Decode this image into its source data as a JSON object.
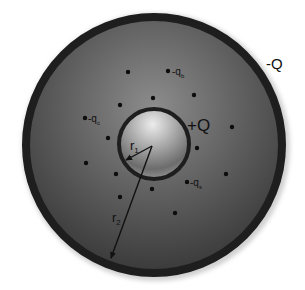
{
  "diagram": {
    "type": "concentric-spheres-charge",
    "outer_shell": {
      "label": "-Q",
      "cx": 154,
      "cy": 145,
      "r": 132,
      "ring_width": 8,
      "ring_color": "#1e1e1e"
    },
    "inner_sphere": {
      "label": "+Q",
      "cx": 154,
      "cy": 144,
      "r": 36,
      "ring_width": 4,
      "ring_color": "#1e1e1e"
    },
    "radii": {
      "r1": {
        "label": "r",
        "sub": "1"
      },
      "r2": {
        "label": "r",
        "sub": "2"
      }
    },
    "charge_labels": [
      {
        "text": "-q",
        "sub": "b",
        "x": 176,
        "y": 74
      },
      {
        "text": "-q",
        "sub": "c",
        "x": 91,
        "y": 121
      },
      {
        "text": "-q",
        "sub": "s",
        "x": 193,
        "y": 185
      }
    ],
    "dots": [
      {
        "x": 128,
        "y": 72
      },
      {
        "x": 168,
        "y": 71
      },
      {
        "x": 153,
        "y": 98
      },
      {
        "x": 194,
        "y": 95
      },
      {
        "x": 120,
        "y": 105
      },
      {
        "x": 85,
        "y": 118
      },
      {
        "x": 232,
        "y": 127
      },
      {
        "x": 108,
        "y": 138
      },
      {
        "x": 86,
        "y": 163
      },
      {
        "x": 116,
        "y": 174
      },
      {
        "x": 120,
        "y": 197
      },
      {
        "x": 152,
        "y": 189
      },
      {
        "x": 187,
        "y": 182
      },
      {
        "x": 226,
        "y": 174
      },
      {
        "x": 197,
        "y": 148
      },
      {
        "x": 175,
        "y": 213
      }
    ],
    "colors": {
      "background": "#ffffff",
      "shell_fill_light": "#8a8a8a",
      "shell_fill_dark": "#3c3c3c",
      "sphere_highlight": "#e6e6e6",
      "sphere_dark": "#6a6a6a",
      "ink": "#111111"
    }
  }
}
